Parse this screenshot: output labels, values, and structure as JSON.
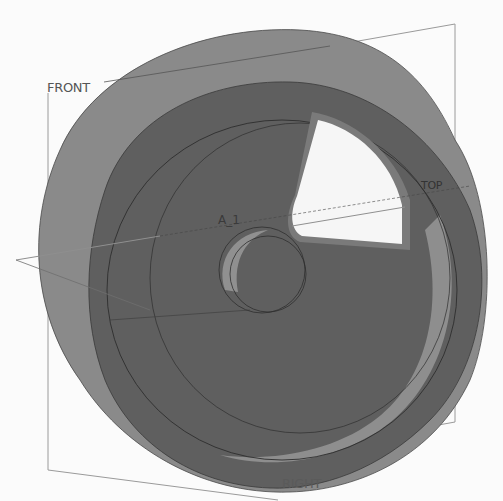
{
  "viewport": {
    "background": "#fbfbfb",
    "model": {
      "name": "wheel-with-cutout",
      "colors": {
        "outer_rim": "#8a8a8a",
        "front_face": "#5f5f5f",
        "inner_band": "#8e8e8e",
        "hub_highlight": "#909090",
        "edge_line": "#2e2e2e",
        "cutout": "#f6f6f6",
        "cutout_wall": "#7a7a7a"
      }
    },
    "datum_planes": [
      {
        "id": "front",
        "label": "FRONT"
      },
      {
        "id": "top",
        "label": "TOP"
      },
      {
        "id": "right",
        "label": "RIGHT"
      }
    ],
    "datum_axes": [
      {
        "id": "a1",
        "label": "A_1"
      }
    ],
    "datum_color": "#8f8f8f"
  }
}
